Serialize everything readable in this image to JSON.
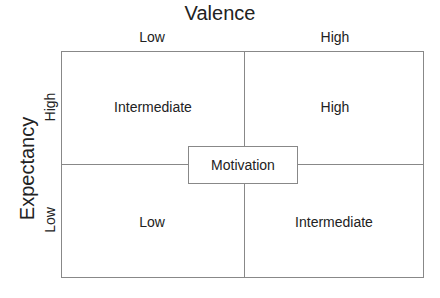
{
  "diagram": {
    "title_x": "Valence",
    "title_y": "Expectancy",
    "x_levels": [
      "Low",
      "High"
    ],
    "y_levels": [
      "High",
      "Low"
    ],
    "cells": {
      "high_expectancy_low_valence": "Intermediate",
      "high_expectancy_high_valence": "High",
      "low_expectancy_low_valence": "Low",
      "low_expectancy_high_valence": "Intermediate"
    },
    "center_label": "Motivation"
  }
}
